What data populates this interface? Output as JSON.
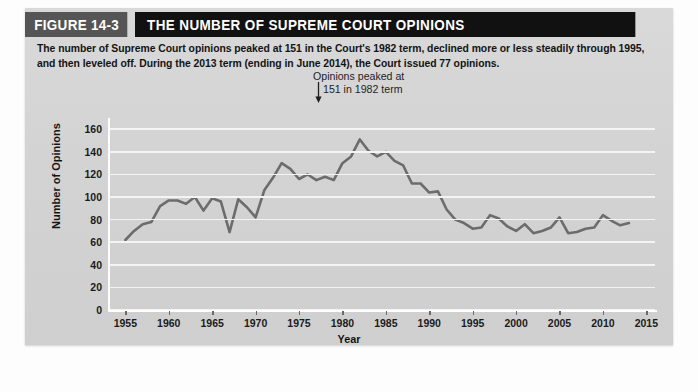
{
  "figure": {
    "tag": "FIGURE 14-3",
    "title": "THE NUMBER OF SUPREME COURT OPINIONS",
    "caption": "The number of Supreme Court opinions peaked at 151 in the Court's 1982 term, declined more or less steadily through 1995, and then leveled off. During the 2013 term (ending in June 2014), the Court issued 77 opinions."
  },
  "colors": {
    "panel_background": "#d5d5d5",
    "header_band": "#111112",
    "header_tag": "#555556",
    "gridline": "#f4f4f4",
    "axis": "#ffffff",
    "line": "#6c6c6c",
    "text": "#141414"
  },
  "chart_data": {
    "type": "line",
    "title": "THE NUMBER OF SUPREME COURT OPINIONS",
    "xlabel": "Year",
    "ylabel": "Number of Opinions",
    "xlim": [
      1953,
      2016
    ],
    "ylim": [
      0,
      170
    ],
    "ytick_labels": [
      "160",
      "140",
      "120",
      "100",
      "80",
      "60",
      "40",
      "20",
      "0"
    ],
    "yticks": [
      160,
      140,
      120,
      100,
      80,
      60,
      40,
      20,
      0
    ],
    "xticks": [
      1955,
      1960,
      1965,
      1970,
      1975,
      1980,
      1985,
      1990,
      1995,
      2000,
      2005,
      2010,
      2015
    ],
    "xtick_labels": [
      "1955",
      "1960",
      "1965",
      "1970",
      "1975",
      "1980",
      "1985",
      "1990",
      "1995",
      "2000",
      "2005",
      "2010",
      "2015"
    ],
    "grid": true,
    "legend": false,
    "annotations": [
      {
        "text_line1": "Opinions peaked at",
        "text_line2": "151 in 1982 term",
        "marker": "down-arrow",
        "points_to_year": 1982,
        "points_to_value": 151
      }
    ],
    "series": [
      {
        "name": "Number of Opinions",
        "x": [
          1955,
          1956,
          1957,
          1958,
          1959,
          1960,
          1961,
          1962,
          1963,
          1964,
          1965,
          1966,
          1967,
          1968,
          1969,
          1970,
          1971,
          1972,
          1973,
          1974,
          1975,
          1976,
          1977,
          1978,
          1979,
          1980,
          1981,
          1982,
          1983,
          1984,
          1985,
          1986,
          1987,
          1988,
          1989,
          1990,
          1991,
          1992,
          1993,
          1994,
          1995,
          1996,
          1997,
          1998,
          1999,
          2000,
          2001,
          2002,
          2003,
          2004,
          2005,
          2006,
          2007,
          2008,
          2009,
          2010,
          2011,
          2012,
          2013
        ],
        "values": [
          62,
          70,
          76,
          78,
          92,
          97,
          97,
          94,
          100,
          88,
          99,
          96,
          69,
          98,
          91,
          82,
          106,
          117,
          130,
          125,
          116,
          120,
          115,
          118,
          115,
          130,
          136,
          151,
          141,
          136,
          140,
          132,
          128,
          112,
          112,
          104,
          105,
          89,
          80,
          77,
          72,
          73,
          84,
          81,
          74,
          70,
          76,
          68,
          70,
          73,
          82,
          68,
          69,
          72,
          73,
          84,
          79,
          75,
          77
        ]
      }
    ]
  }
}
